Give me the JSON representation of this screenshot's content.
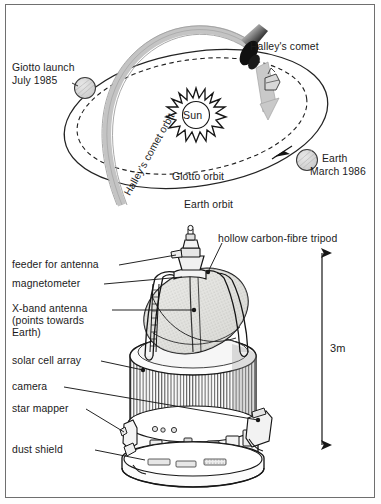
{
  "figure": {
    "title_visible": false,
    "background": "#ffffff",
    "border_color": "#6f6f6f"
  },
  "orbit_diagram": {
    "name": "giotto-mission-orbit-diagram",
    "labels": {
      "giotto_launch": "Giotto launch",
      "giotto_launch_date": "July 1985",
      "halleys_comet": "Halley's comet",
      "halleys_comet_orbit": "Halley's comet orbit",
      "sun": "Sun",
      "earth": "Earth",
      "earth_date": "March 1986",
      "giotto_orbit": "Giotto orbit",
      "earth_orbit": "Earth orbit"
    },
    "colors": {
      "orbit_line": "#2b2b2b",
      "comet_tail": "#b9b9b9",
      "comet_nucleus": "#141414",
      "planet_fill": "#d6d6d6",
      "sun_outline": "#1a1a1a"
    }
  },
  "spacecraft_diagram": {
    "name": "giotto-spacecraft-cutaway",
    "labels": {
      "hollow_tripod": "hollow carbon-fibre tripod",
      "feeder": "feeder for antenna",
      "magnetometer": "magnetometer",
      "x_band_antenna_line1": "X-band antenna",
      "x_band_antenna_line2": "(points towards",
      "x_band_antenna_line3": "Earth)",
      "solar_cell_array": "solar cell array",
      "camera": "camera",
      "star_mapper": "star mapper",
      "dust_shield": "dust shield"
    },
    "dimension": {
      "value": "3m",
      "name": "height-dimension"
    },
    "colors": {
      "outline": "#1c1c1c",
      "panel_fill": "#f2f2f2",
      "dish_fill": "#dcdcd6",
      "shade": "#c8c8c8"
    }
  }
}
